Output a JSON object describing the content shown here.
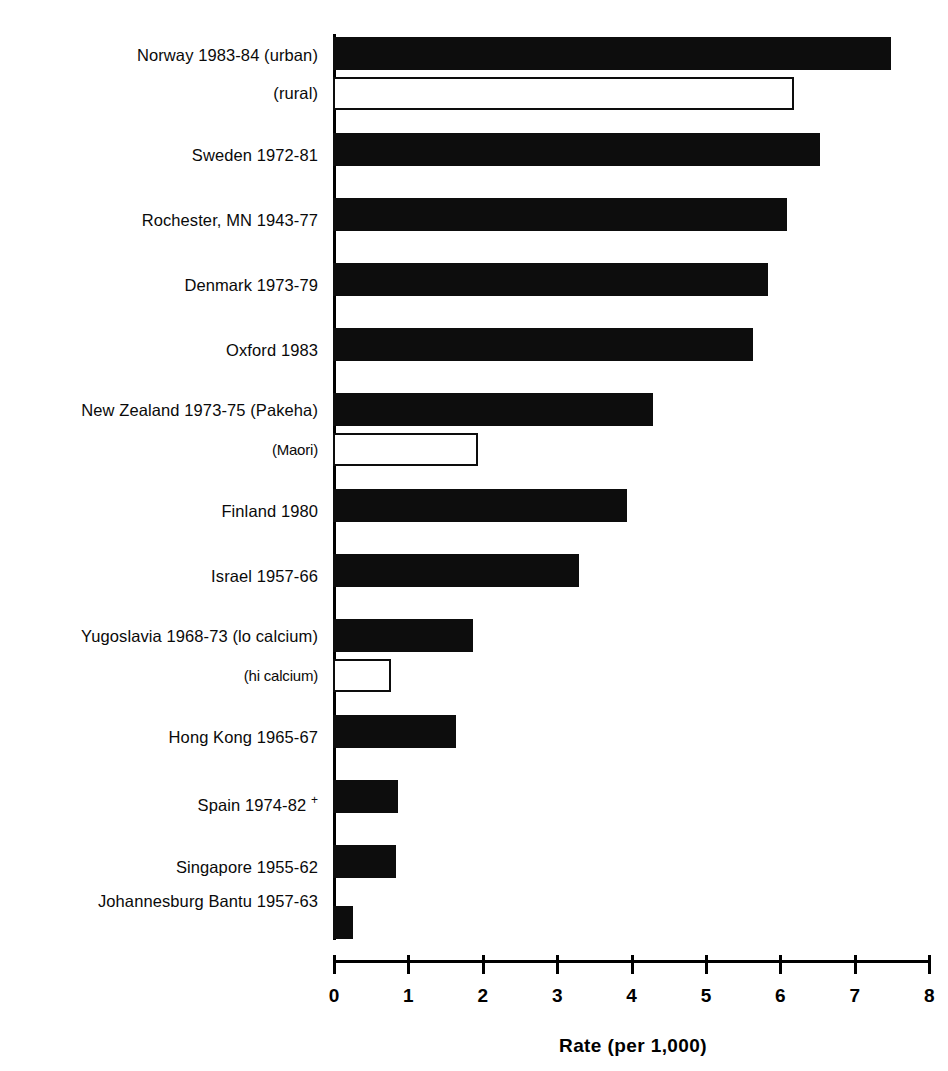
{
  "chart_data": {
    "type": "bar",
    "orientation": "horizontal",
    "title": "",
    "xlabel": "Rate  (per  1,000)",
    "ylabel": "",
    "xlim": [
      0,
      8
    ],
    "xticks": [
      0,
      1,
      2,
      3,
      4,
      5,
      6,
      7,
      8
    ],
    "xticklabels": [
      "0",
      "1",
      "2",
      "3",
      "4",
      "5",
      "6",
      "7",
      "8"
    ],
    "grid": false,
    "legend": "none",
    "categories": [
      "Norway 1983-84 (urban)",
      "(rural)",
      "Sweden 1972-81",
      "Rochester, MN 1943-77",
      "Denmark 1973-79",
      "Oxford 1983",
      "New Zealand 1973-75 (Pakeha)",
      "(Maori)",
      "Finland 1980",
      "Israel 1957-66",
      "Yugoslavia 1968-73 (lo calcium)",
      "(hi calcium)",
      "Hong Kong 1965-67",
      "Spain 1974-82 +",
      "Singapore 1955-62",
      "Johannesburg Bantu 1957-63"
    ],
    "values": [
      7.5,
      6.2,
      6.55,
      6.1,
      5.85,
      5.65,
      4.3,
      1.95,
      3.95,
      3.3,
      1.88,
      0.78,
      1.65,
      0.87,
      0.85,
      0.27
    ],
    "styles": [
      "filled",
      "hollow",
      "filled",
      "filled",
      "filled",
      "filled",
      "filled",
      "hollow",
      "filled",
      "filled",
      "filled",
      "hollow",
      "filled",
      "filled",
      "filled",
      "filled"
    ]
  },
  "bars": [
    {
      "label": "Norway 1983-84 (urban)",
      "label_sub": false,
      "value": 7.5,
      "style": "filled",
      "top": 37,
      "label_top": 47,
      "gap_after": false
    },
    {
      "label": "(rural)",
      "label_sub": false,
      "value": 6.2,
      "style": "hollow",
      "top": 77,
      "label_top": 85,
      "gap_after": true
    },
    {
      "label": "Sweden 1972-81",
      "label_sub": false,
      "value": 6.55,
      "style": "filled",
      "top": 133,
      "label_top": 147,
      "gap_after": true
    },
    {
      "label": "Rochester, MN 1943-77",
      "label_sub": false,
      "value": 6.1,
      "style": "filled",
      "top": 198,
      "label_top": 212,
      "gap_after": true
    },
    {
      "label": "Denmark 1973-79",
      "label_sub": false,
      "value": 5.85,
      "style": "filled",
      "top": 263,
      "label_top": 277,
      "gap_after": true
    },
    {
      "label": "Oxford 1983",
      "label_sub": false,
      "value": 5.65,
      "style": "filled",
      "top": 328,
      "label_top": 342,
      "gap_after": true
    },
    {
      "label": "New Zealand 1973-75 (Pakeha)",
      "label_sub": false,
      "value": 4.3,
      "style": "filled",
      "top": 393,
      "label_top": 402,
      "gap_after": false
    },
    {
      "label": "(Maori)",
      "label_sub": true,
      "value": 1.95,
      "style": "hollow",
      "top": 433,
      "label_top": 442,
      "gap_after": true
    },
    {
      "label": "Finland 1980",
      "label_sub": false,
      "value": 3.95,
      "style": "filled",
      "top": 489,
      "label_top": 503,
      "gap_after": true
    },
    {
      "label": "Israel 1957-66",
      "label_sub": false,
      "value": 3.3,
      "style": "filled",
      "top": 554,
      "label_top": 568,
      "gap_after": true
    },
    {
      "label": "Yugoslavia 1968-73 (lo calcium)",
      "label_sub": false,
      "value": 1.88,
      "style": "filled",
      "top": 619,
      "label_top": 628,
      "gap_after": false
    },
    {
      "label": "(hi calcium)",
      "label_sub": true,
      "value": 0.78,
      "style": "hollow",
      "top": 659,
      "label_top": 668,
      "gap_after": true
    },
    {
      "label": "Hong Kong 1965-67",
      "label_sub": false,
      "value": 1.65,
      "style": "filled",
      "top": 715,
      "label_top": 729,
      "gap_after": true
    },
    {
      "label": "Spain 1974-82 +",
      "label_sub": false,
      "value": 0.87,
      "style": "filled",
      "top": 780,
      "label_top": 794,
      "gap_after": true
    },
    {
      "label": "Singapore 1955-62",
      "label_sub": false,
      "value": 0.85,
      "style": "filled",
      "top": 845,
      "label_top": 859,
      "gap_after": true
    },
    {
      "label": "Johannesburg Bantu 1957-63",
      "label_sub": false,
      "value": 0.27,
      "style": "filled",
      "top": 906,
      "label_top": 893,
      "gap_after": false
    }
  ],
  "axis": {
    "ticks": [
      "0",
      "1",
      "2",
      "3",
      "4",
      "5",
      "6",
      "7",
      "8"
    ],
    "title": "Rate  (per  1,000)"
  }
}
